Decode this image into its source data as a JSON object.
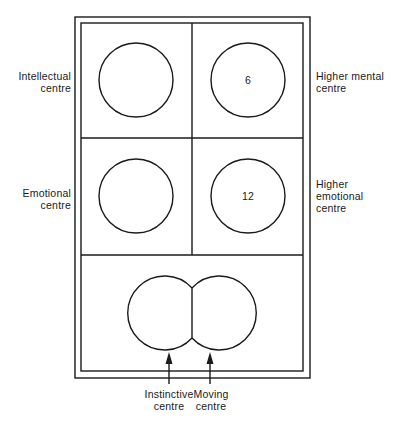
{
  "diagram": {
    "colors": {
      "stroke": "#1a1a1a",
      "background": "#ffffff"
    },
    "centres": [
      {
        "id": "intellectual",
        "label_line1": "Intellectual",
        "label_line2": "centre",
        "number": ""
      },
      {
        "id": "higher-mental",
        "label_line1": "Higher mental",
        "label_line2": "centre",
        "number": "6"
      },
      {
        "id": "emotional",
        "label_line1": "Emotional",
        "label_line2": "centre",
        "number": ""
      },
      {
        "id": "higher-emotional",
        "label_line1": "Higher",
        "label_line2": "emotional",
        "label_line3": "centre",
        "number": "12"
      },
      {
        "id": "instinctive",
        "label_line1": "Instinctive",
        "label_line2": "centre"
      },
      {
        "id": "moving",
        "label_line1": "Moving",
        "label_line2": "centre"
      }
    ]
  }
}
